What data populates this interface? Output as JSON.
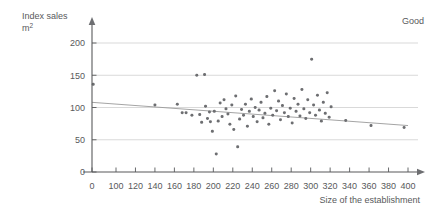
{
  "chart_data": {
    "type": "scatter",
    "title": "",
    "corner_label": "Good",
    "xlabel": "Size of the establishment",
    "ylabel_line1": "Index sales",
    "ylabel_line2": "m",
    "ylabel_sup": "2",
    "xlim": [
      0,
      400
    ],
    "ylim": [
      0,
      215
    ],
    "x_break_after": 0,
    "x_first_gap_to": 100,
    "xticks": [
      0,
      100,
      120,
      140,
      160,
      180,
      200,
      220,
      240,
      260,
      280,
      300,
      320,
      340,
      360,
      380,
      400
    ],
    "yticks": [
      0,
      50,
      100,
      150,
      200
    ],
    "grid": "horizontal",
    "gridlines_at": [
      50,
      100,
      150,
      200
    ],
    "legend": "none",
    "series_name": "establishments",
    "point_color": "#6d6e71",
    "grid_color": "#c9c9c9",
    "axis_color": "#58595b",
    "trendline_color": "#9a9a9a",
    "trendline": {
      "x_start": 0,
      "y_start": 108,
      "x_end": 400,
      "y_end": 72
    },
    "points": [
      [
        5,
        136
      ],
      [
        140,
        104
      ],
      [
        163,
        105
      ],
      [
        168,
        92
      ],
      [
        172,
        92
      ],
      [
        178,
        88
      ],
      [
        183,
        150
      ],
      [
        186,
        89
      ],
      [
        188,
        77
      ],
      [
        191,
        151
      ],
      [
        192,
        102
      ],
      [
        194,
        83
      ],
      [
        196,
        93
      ],
      [
        197,
        78
      ],
      [
        199,
        63
      ],
      [
        201,
        94
      ],
      [
        203,
        28
      ],
      [
        205,
        79
      ],
      [
        207,
        107
      ],
      [
        209,
        86
      ],
      [
        211,
        112
      ],
      [
        213,
        98
      ],
      [
        215,
        90
      ],
      [
        217,
        74
      ],
      [
        219,
        104
      ],
      [
        221,
        66
      ],
      [
        223,
        118
      ],
      [
        225,
        39
      ],
      [
        227,
        82
      ],
      [
        229,
        97
      ],
      [
        231,
        88
      ],
      [
        233,
        105
      ],
      [
        235,
        71
      ],
      [
        237,
        94
      ],
      [
        239,
        113
      ],
      [
        241,
        86
      ],
      [
        243,
        100
      ],
      [
        245,
        78
      ],
      [
        247,
        96
      ],
      [
        249,
        108
      ],
      [
        251,
        84
      ],
      [
        253,
        91
      ],
      [
        255,
        117
      ],
      [
        257,
        74
      ],
      [
        259,
        99
      ],
      [
        261,
        88
      ],
      [
        263,
        126
      ],
      [
        265,
        95
      ],
      [
        267,
        110
      ],
      [
        269,
        81
      ],
      [
        271,
        103
      ],
      [
        273,
        92
      ],
      [
        275,
        121
      ],
      [
        277,
        86
      ],
      [
        279,
        99
      ],
      [
        281,
        76
      ],
      [
        283,
        114
      ],
      [
        285,
        94
      ],
      [
        287,
        105
      ],
      [
        289,
        87
      ],
      [
        291,
        128
      ],
      [
        293,
        98
      ],
      [
        295,
        83
      ],
      [
        297,
        112
      ],
      [
        299,
        92
      ],
      [
        301,
        175
      ],
      [
        303,
        104
      ],
      [
        305,
        88
      ],
      [
        307,
        119
      ],
      [
        309,
        96
      ],
      [
        311,
        79
      ],
      [
        313,
        108
      ],
      [
        315,
        91
      ],
      [
        317,
        123
      ],
      [
        319,
        85
      ],
      [
        321,
        101
      ],
      [
        336,
        80
      ],
      [
        362,
        72
      ],
      [
        396,
        69
      ]
    ]
  }
}
